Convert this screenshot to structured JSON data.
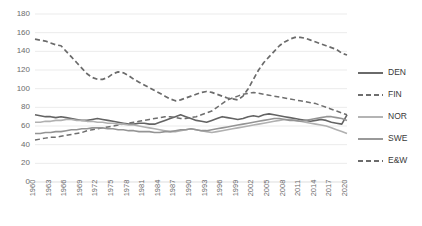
{
  "chart_data": {
    "type": "line",
    "title": "",
    "xlabel": "",
    "ylabel": "",
    "xlim": [
      1960,
      2020
    ],
    "ylim": [
      0,
      180
    ],
    "ytick_step": 20,
    "yticks": [
      0,
      20,
      40,
      60,
      80,
      100,
      120,
      140,
      160,
      180
    ],
    "xticks": [
      1960,
      1963,
      1966,
      1969,
      1972,
      1975,
      1978,
      1981,
      1984,
      1987,
      1990,
      1993,
      1996,
      1999,
      2002,
      2005,
      2008,
      2011,
      2014,
      2017,
      2020
    ],
    "grid": true,
    "legend_position": "right",
    "x": [
      1960,
      1961,
      1962,
      1963,
      1964,
      1965,
      1966,
      1967,
      1968,
      1969,
      1970,
      1971,
      1972,
      1973,
      1974,
      1975,
      1976,
      1977,
      1978,
      1979,
      1980,
      1981,
      1982,
      1983,
      1984,
      1985,
      1986,
      1987,
      1988,
      1989,
      1990,
      1991,
      1992,
      1993,
      1994,
      1995,
      1996,
      1997,
      1998,
      1999,
      2000,
      2001,
      2002,
      2003,
      2004,
      2005,
      2006,
      2007,
      2008,
      2009,
      2010,
      2011,
      2012,
      2013,
      2014,
      2015,
      2016,
      2017,
      2018,
      2019,
      2020
    ],
    "series": [
      {
        "name": "DEN",
        "color": "#636363",
        "width": 1.6,
        "dash": "none",
        "values": [
          72,
          71,
          70,
          70,
          69,
          70,
          69,
          68,
          67,
          66,
          66,
          67,
          68,
          67,
          66,
          65,
          64,
          63,
          62,
          62,
          63,
          63,
          62,
          62,
          64,
          66,
          68,
          70,
          72,
          70,
          68,
          66,
          65,
          64,
          66,
          68,
          70,
          69,
          68,
          67,
          68,
          70,
          71,
          70,
          72,
          73,
          72,
          71,
          70,
          69,
          68,
          67,
          66,
          65,
          66,
          67,
          66,
          64,
          63,
          62,
          72
        ]
      },
      {
        "name": "FIN",
        "color": "#6e6e6e",
        "width": 1.5,
        "dash": "5,3",
        "values": [
          45,
          46,
          47,
          48,
          48,
          49,
          50,
          51,
          52,
          53,
          55,
          56,
          57,
          58,
          59,
          60,
          61,
          62,
          63,
          64,
          65,
          66,
          67,
          68,
          69,
          70,
          70,
          69,
          68,
          68,
          69,
          70,
          72,
          74,
          76,
          80,
          84,
          88,
          90,
          92,
          94,
          95,
          96,
          95,
          94,
          93,
          92,
          91,
          90,
          89,
          88,
          87,
          86,
          85,
          84,
          82,
          80,
          78,
          76,
          74,
          72
        ]
      },
      {
        "name": "NOR",
        "color": "#b0b0b0",
        "width": 1.6,
        "dash": "none",
        "values": [
          64,
          64,
          65,
          65,
          66,
          66,
          67,
          67,
          66,
          66,
          65,
          65,
          64,
          64,
          63,
          63,
          62,
          62,
          61,
          61,
          60,
          59,
          58,
          57,
          56,
          55,
          54,
          54,
          55,
          56,
          57,
          56,
          55,
          54,
          53,
          54,
          55,
          56,
          57,
          58,
          59,
          60,
          61,
          62,
          63,
          64,
          65,
          66,
          67,
          67,
          66,
          65,
          64,
          63,
          62,
          61,
          60,
          58,
          56,
          54,
          52
        ]
      },
      {
        "name": "SWE",
        "color": "#949494",
        "width": 1.6,
        "dash": "none",
        "values": [
          52,
          52,
          53,
          53,
          54,
          54,
          55,
          56,
          56,
          57,
          57,
          58,
          58,
          58,
          57,
          57,
          56,
          56,
          55,
          55,
          54,
          54,
          54,
          53,
          53,
          54,
          54,
          55,
          56,
          56,
          57,
          56,
          55,
          55,
          56,
          57,
          58,
          59,
          60,
          61,
          62,
          63,
          64,
          65,
          66,
          67,
          68,
          68,
          67,
          66,
          66,
          65,
          66,
          67,
          68,
          69,
          70,
          70,
          69,
          68,
          66
        ]
      },
      {
        "name": "E&W",
        "color": "#6b6b6b",
        "width": 1.7,
        "dash": "5,3",
        "values": [
          153,
          152,
          151,
          149,
          147,
          146,
          140,
          134,
          128,
          122,
          116,
          112,
          110,
          110,
          112,
          116,
          118,
          117,
          114,
          110,
          107,
          104,
          101,
          98,
          95,
          92,
          89,
          87,
          88,
          90,
          92,
          94,
          96,
          97,
          96,
          94,
          92,
          90,
          89,
          88,
          92,
          100,
          110,
          120,
          128,
          134,
          140,
          146,
          150,
          153,
          155,
          155,
          154,
          152,
          150,
          148,
          146,
          144,
          142,
          138,
          136
        ]
      }
    ]
  },
  "legend": {
    "items": [
      {
        "label": "DEN"
      },
      {
        "label": "FIN"
      },
      {
        "label": "NOR"
      },
      {
        "label": "SWE"
      },
      {
        "label": "E&W"
      }
    ]
  }
}
